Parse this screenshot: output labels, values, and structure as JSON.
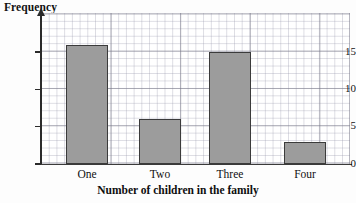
{
  "chart_data": {
    "type": "bar",
    "title": "",
    "ylabel": "Frequency",
    "xlabel": "Number of children in the family",
    "categories": [
      "One",
      "Two",
      "Three",
      "Four"
    ],
    "values": [
      16,
      6,
      15,
      3
    ],
    "ylim": [
      0,
      18
    ],
    "yticks": [
      "0",
      "5",
      "10",
      "15"
    ],
    "ytick_values": [
      0,
      5,
      10,
      15
    ],
    "grid": true,
    "legend": "none",
    "bar_color": "#9c9c9c",
    "bar_edge_color": "#3b3b3b",
    "axis_color": "#2b2b2b",
    "grid_color": "#9696aa"
  },
  "axes": {
    "y_title": "Frequency",
    "x_title": "Number of children in the family"
  }
}
